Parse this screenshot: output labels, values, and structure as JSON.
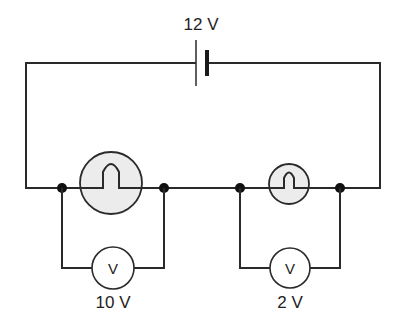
{
  "diagram": {
    "type": "electrical-circuit",
    "battery": {
      "label": "12 V"
    },
    "lamps": [
      {
        "name": "large-lamp",
        "size": "large"
      },
      {
        "name": "small-lamp",
        "size": "small"
      }
    ],
    "voltmeters": [
      {
        "symbol": "V",
        "reading": "10 V"
      },
      {
        "symbol": "V",
        "reading": "2 V"
      }
    ],
    "colors": {
      "wire": "#2a2a2a",
      "lamp_fill": "#ececec",
      "background": "#ffffff"
    }
  }
}
